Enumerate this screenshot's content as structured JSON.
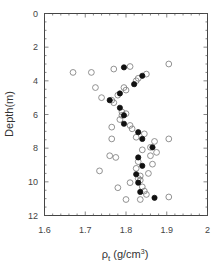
{
  "chart_data": {
    "type": "scatter",
    "title": "",
    "xlabel": "ρt (g/cm³)",
    "ylabel": "Depth(m)",
    "xlim": [
      1.6,
      2.0
    ],
    "ylim": [
      12,
      0
    ],
    "y_inverted": true,
    "grid": false,
    "legend": null,
    "x_ticks": [
      "1.6",
      "1.7",
      "1.8",
      "1.9",
      "2"
    ],
    "y_ticks": [
      "0",
      "2",
      "4",
      "6",
      "8",
      "10",
      "12"
    ],
    "series": [
      {
        "name": "open-circles",
        "marker": "open-circle",
        "points": [
          [
            1.905,
            3.0
          ],
          [
            1.81,
            3.15
          ],
          [
            1.77,
            3.3
          ],
          [
            1.67,
            3.5
          ],
          [
            1.715,
            3.5
          ],
          [
            1.85,
            3.6
          ],
          [
            1.83,
            3.85
          ],
          [
            1.825,
            4.0
          ],
          [
            1.725,
            4.4
          ],
          [
            1.795,
            4.4
          ],
          [
            1.8,
            4.55
          ],
          [
            1.78,
            4.85
          ],
          [
            1.74,
            5.0
          ],
          [
            1.765,
            5.15
          ],
          [
            1.77,
            5.3
          ],
          [
            1.79,
            5.85
          ],
          [
            1.8,
            5.95
          ],
          [
            1.79,
            6.05
          ],
          [
            1.785,
            6.3
          ],
          [
            1.765,
            6.75
          ],
          [
            1.81,
            6.65
          ],
          [
            1.815,
            6.85
          ],
          [
            1.845,
            7.15
          ],
          [
            1.825,
            7.35
          ],
          [
            1.765,
            7.45
          ],
          [
            1.905,
            7.45
          ],
          [
            1.87,
            7.6
          ],
          [
            1.86,
            7.95
          ],
          [
            1.84,
            8.1
          ],
          [
            1.875,
            8.25
          ],
          [
            1.86,
            8.45
          ],
          [
            1.76,
            8.45
          ],
          [
            1.775,
            8.55
          ],
          [
            1.83,
            8.8
          ],
          [
            1.865,
            8.95
          ],
          [
            1.825,
            9.2
          ],
          [
            1.735,
            9.35
          ],
          [
            1.855,
            9.5
          ],
          [
            1.835,
            9.65
          ],
          [
            1.83,
            9.8
          ],
          [
            1.835,
            9.9
          ],
          [
            1.81,
            10.05
          ],
          [
            1.84,
            10.3
          ],
          [
            1.78,
            10.35
          ],
          [
            1.845,
            10.55
          ],
          [
            1.85,
            10.75
          ],
          [
            1.905,
            10.9
          ],
          [
            1.8,
            11.05
          ],
          [
            1.835,
            11.05
          ]
        ]
      },
      {
        "name": "filled-circles",
        "marker": "filled-circle",
        "points": [
          [
            1.795,
            3.2
          ],
          [
            1.84,
            3.7
          ],
          [
            1.82,
            4.2
          ],
          [
            1.785,
            4.75
          ],
          [
            1.76,
            5.15
          ],
          [
            1.785,
            5.6
          ],
          [
            1.795,
            6.05
          ],
          [
            1.795,
            6.55
          ],
          [
            1.83,
            7.05
          ],
          [
            1.84,
            7.45
          ],
          [
            1.865,
            7.95
          ],
          [
            1.83,
            8.55
          ],
          [
            1.84,
            9.05
          ],
          [
            1.825,
            9.55
          ],
          [
            1.83,
            10.05
          ],
          [
            1.835,
            10.6
          ],
          [
            1.87,
            10.95
          ]
        ]
      }
    ]
  },
  "colors": {
    "axis": "#444444",
    "marker_open_stroke": "#777777",
    "marker_filled": "#111111"
  }
}
